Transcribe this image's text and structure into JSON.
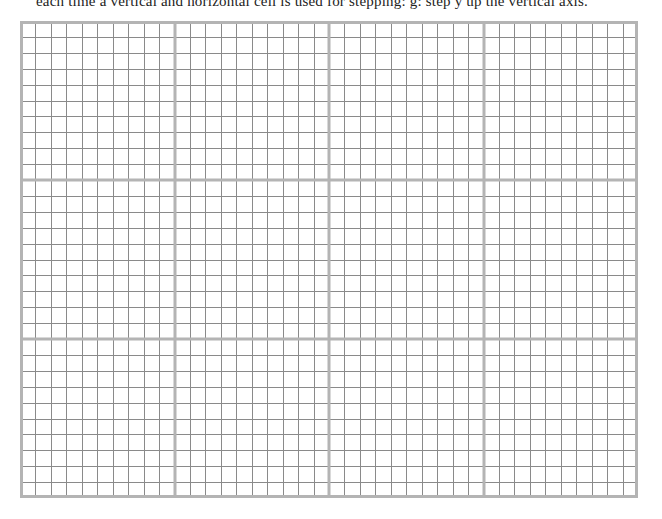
{
  "caption": {
    "text": "each time a vertical and horizontal cell is used for stepping: g: step y up the vertical axis."
  },
  "grid": {
    "columns": 40,
    "rows": 30,
    "major_every": 10,
    "minor_color": "#8a8a8a",
    "major_color": "#b4b4b4",
    "background": "#ffffff"
  }
}
